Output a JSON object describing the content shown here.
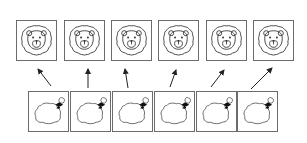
{
  "diagram": {
    "type": "matching-exercise",
    "top_row": {
      "item_icon": "lion-face-icon",
      "items": [
        {
          "id": 1,
          "x": 16,
          "y": 20
        },
        {
          "id": 2,
          "x": 64,
          "y": 20
        },
        {
          "id": 3,
          "x": 111,
          "y": 20
        },
        {
          "id": 4,
          "x": 158,
          "y": 20
        },
        {
          "id": 5,
          "x": 206,
          "y": 20
        },
        {
          "id": 6,
          "x": 253,
          "y": 20
        }
      ],
      "size": 41
    },
    "bottom_row": {
      "item_icon": "bag-with-bow-icon",
      "items": [
        {
          "id": 1,
          "x": 28,
          "y": 91
        },
        {
          "id": 2,
          "x": 70,
          "y": 91
        },
        {
          "id": 3,
          "x": 112,
          "y": 91
        },
        {
          "id": 4,
          "x": 154,
          "y": 91
        },
        {
          "id": 5,
          "x": 196,
          "y": 91
        },
        {
          "id": 6,
          "x": 237,
          "y": 91
        }
      ],
      "size": 41
    },
    "arrows": [
      {
        "from": 1,
        "to": 1,
        "x1": 51,
        "y1": 86,
        "x2": 38,
        "y2": 69
      },
      {
        "from": 2,
        "to": 2,
        "x1": 88,
        "y1": 88,
        "x2": 88,
        "y2": 69
      },
      {
        "from": 3,
        "to": 3,
        "x1": 128,
        "y1": 88,
        "x2": 125,
        "y2": 69
      },
      {
        "from": 4,
        "to": 4,
        "x1": 170,
        "y1": 87,
        "x2": 176,
        "y2": 70
      },
      {
        "from": 5,
        "to": 5,
        "x1": 211,
        "y1": 87,
        "x2": 224,
        "y2": 70
      },
      {
        "from": 6,
        "to": 6,
        "x1": 251,
        "y1": 89,
        "x2": 272,
        "y2": 68
      }
    ],
    "colors": {
      "border": "#6b6b6b",
      "line": "#333333",
      "arrow": "#222222",
      "background": "#ffffff"
    }
  }
}
